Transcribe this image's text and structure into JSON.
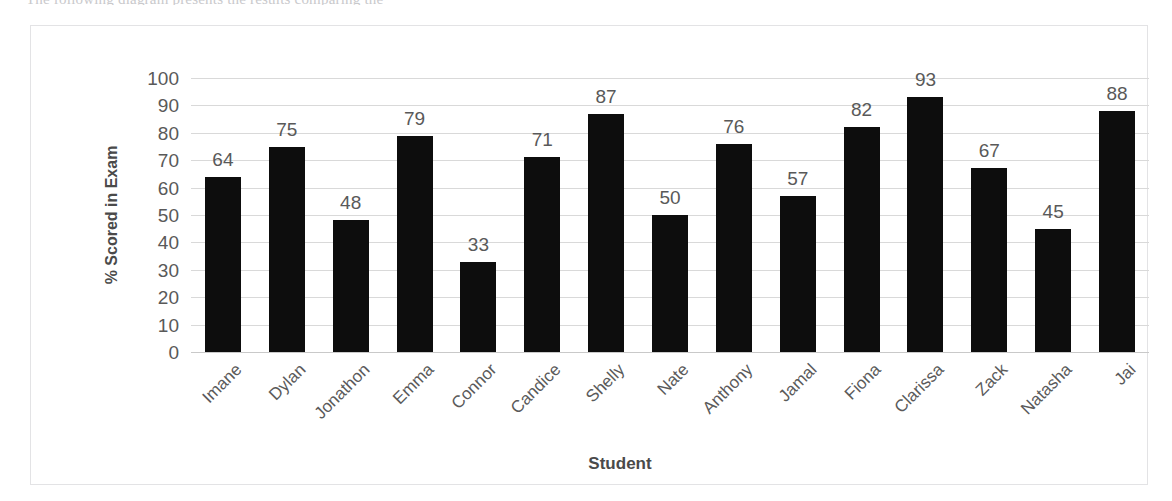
{
  "page": {
    "cutoff_text": "The following diagram presents the results comparing the"
  },
  "chart_data": {
    "type": "bar",
    "title": "",
    "xlabel": "Student",
    "ylabel": "% Scored in Exam",
    "categories": [
      "Imane",
      "Dylan",
      "Jonathon",
      "Emma",
      "Connor",
      "Candice",
      "Shelly",
      "Nate",
      "Anthony",
      "Jamal",
      "Fiona",
      "Clarissa",
      "Zack",
      "Natasha",
      "Jai"
    ],
    "values": [
      64,
      75,
      48,
      79,
      33,
      71,
      87,
      50,
      76,
      57,
      82,
      93,
      67,
      45,
      88
    ],
    "ylim": [
      0,
      100
    ],
    "y_ticks": [
      0,
      10,
      20,
      30,
      40,
      50,
      60,
      70,
      80,
      90,
      100
    ],
    "grid": true,
    "legend": "none",
    "bar_color": "#0d0d0d",
    "gridline_color": "#d9d9d9",
    "label_color": "#595959"
  }
}
